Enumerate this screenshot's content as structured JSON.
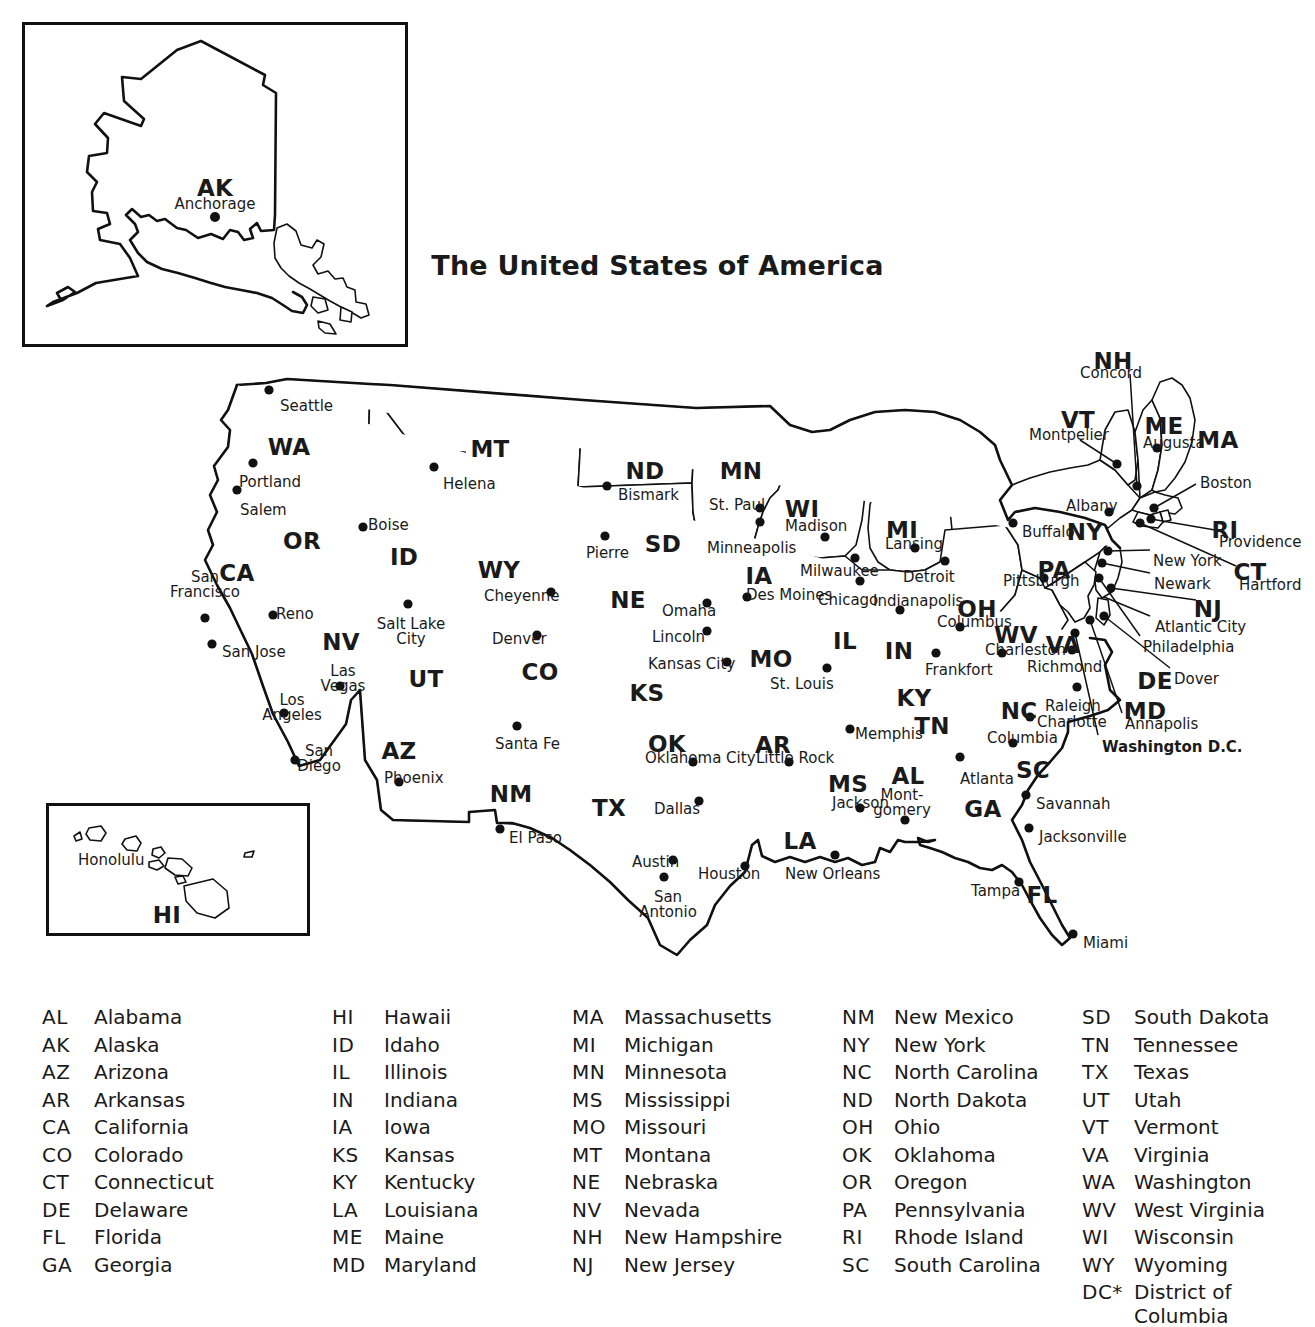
{
  "title": "The United States of America",
  "insets": [
    {
      "key": "ak",
      "abbr": "AK",
      "city": "Anchorage"
    },
    {
      "key": "hi",
      "abbr": "HI",
      "city": "Honolulu"
    }
  ],
  "state_labels": [
    {
      "abbr": "WA",
      "x": 289,
      "y": 436
    },
    {
      "abbr": "OR",
      "x": 302,
      "y": 530
    },
    {
      "abbr": "CA",
      "x": 237,
      "y": 562
    },
    {
      "abbr": "NV",
      "x": 341,
      "y": 631
    },
    {
      "abbr": "ID",
      "x": 404,
      "y": 546
    },
    {
      "abbr": "MT",
      "x": 490,
      "y": 438
    },
    {
      "abbr": "WY",
      "x": 499,
      "y": 559
    },
    {
      "abbr": "UT",
      "x": 426,
      "y": 668
    },
    {
      "abbr": "AZ",
      "x": 399,
      "y": 740
    },
    {
      "abbr": "CO",
      "x": 540,
      "y": 661
    },
    {
      "abbr": "NM",
      "x": 511,
      "y": 783
    },
    {
      "abbr": "TX",
      "x": 609,
      "y": 797
    },
    {
      "abbr": "ND",
      "x": 645,
      "y": 460
    },
    {
      "abbr": "SD",
      "x": 663,
      "y": 533
    },
    {
      "abbr": "NE",
      "x": 628,
      "y": 589
    },
    {
      "abbr": "KS",
      "x": 647,
      "y": 682
    },
    {
      "abbr": "OK",
      "x": 667,
      "y": 733
    },
    {
      "abbr": "MN",
      "x": 741,
      "y": 460
    },
    {
      "abbr": "IA",
      "x": 759,
      "y": 565
    },
    {
      "abbr": "MO",
      "x": 771,
      "y": 648
    },
    {
      "abbr": "AR",
      "x": 773,
      "y": 734
    },
    {
      "abbr": "LA",
      "x": 800,
      "y": 830
    },
    {
      "abbr": "WI",
      "x": 802,
      "y": 498
    },
    {
      "abbr": "IL",
      "x": 845,
      "y": 630
    },
    {
      "abbr": "MS",
      "x": 848,
      "y": 773
    },
    {
      "abbr": "MI",
      "x": 902,
      "y": 519
    },
    {
      "abbr": "IN",
      "x": 899,
      "y": 640
    },
    {
      "abbr": "KY",
      "x": 914,
      "y": 687
    },
    {
      "abbr": "TN",
      "x": 932,
      "y": 715
    },
    {
      "abbr": "AL",
      "x": 908,
      "y": 765
    },
    {
      "abbr": "GA",
      "x": 983,
      "y": 798
    },
    {
      "abbr": "OH",
      "x": 977,
      "y": 598
    },
    {
      "abbr": "WV",
      "x": 1016,
      "y": 624
    },
    {
      "abbr": "VA",
      "x": 1063,
      "y": 634
    },
    {
      "abbr": "NC",
      "x": 1019,
      "y": 700
    },
    {
      "abbr": "SC",
      "x": 1033,
      "y": 759
    },
    {
      "abbr": "FL",
      "x": 1042,
      "y": 884
    },
    {
      "abbr": "PA",
      "x": 1054,
      "y": 559
    },
    {
      "abbr": "NY",
      "x": 1085,
      "y": 521
    },
    {
      "abbr": "VT",
      "x": 1078,
      "y": 409
    },
    {
      "abbr": "NH",
      "x": 1113,
      "y": 350
    },
    {
      "abbr": "ME",
      "x": 1164,
      "y": 415
    },
    {
      "abbr": "MA",
      "x": 1218,
      "y": 429
    },
    {
      "abbr": "RI",
      "x": 1225,
      "y": 519
    },
    {
      "abbr": "CT",
      "x": 1250,
      "y": 561
    },
    {
      "abbr": "NJ",
      "x": 1208,
      "y": 598
    },
    {
      "abbr": "DE",
      "x": 1155,
      "y": 670
    },
    {
      "abbr": "MD",
      "x": 1145,
      "y": 700
    }
  ],
  "cities": [
    {
      "name": "Seattle",
      "x": 280,
      "y": 399,
      "align": "left",
      "dot": {
        "x": 269,
        "y": 390
      }
    },
    {
      "name": "Portland",
      "x": 239,
      "y": 475,
      "align": "left",
      "dot": {
        "x": 253,
        "y": 463
      }
    },
    {
      "name": "Salem",
      "x": 240,
      "y": 503,
      "align": "left",
      "dot": {
        "x": 237,
        "y": 490
      }
    },
    {
      "name": "Boise",
      "x": 368,
      "y": 518,
      "align": "left",
      "dot": {
        "x": 363,
        "y": 527
      }
    },
    {
      "name": "Helena",
      "x": 443,
      "y": 477,
      "align": "left",
      "dot": {
        "x": 434,
        "y": 467
      }
    },
    {
      "name": "Cheyenne",
      "x": 484,
      "y": 589,
      "align": "left",
      "dot": {
        "x": 551,
        "y": 592
      }
    },
    {
      "name": "Denver",
      "x": 492,
      "y": 632,
      "align": "left",
      "dot": {
        "x": 537,
        "y": 635
      }
    },
    {
      "name": "Reno",
      "x": 276,
      "y": 607,
      "align": "left",
      "dot": {
        "x": 273,
        "y": 615
      }
    },
    {
      "name": "San Jose",
      "x": 222,
      "y": 645,
      "align": "left",
      "dot": {
        "x": 212,
        "y": 644
      }
    },
    {
      "name": "Santa Fe",
      "x": 495,
      "y": 737,
      "align": "left",
      "dot": {
        "x": 517,
        "y": 726
      }
    },
    {
      "name": "Phoenix",
      "x": 384,
      "y": 771,
      "align": "left",
      "dot": {
        "x": 399,
        "y": 782
      }
    },
    {
      "name": "El Paso",
      "x": 509,
      "y": 831,
      "align": "left",
      "dot": {
        "x": 500,
        "y": 829
      }
    },
    {
      "name": "Bismark",
      "x": 618,
      "y": 488,
      "align": "left",
      "dot": {
        "x": 607,
        "y": 486
      }
    },
    {
      "name": "Pierre",
      "x": 586,
      "y": 546,
      "align": "left",
      "dot": {
        "x": 605,
        "y": 536
      }
    },
    {
      "name": "St. Paul",
      "x": 709,
      "y": 498,
      "align": "left",
      "dot": {
        "x": 760,
        "y": 508
      }
    },
    {
      "name": "Minneapolis",
      "x": 707,
      "y": 541,
      "align": "left",
      "dot": {
        "x": 760,
        "y": 522
      }
    },
    {
      "name": "Omaha",
      "x": 662,
      "y": 604,
      "align": "left",
      "dot": {
        "x": 707,
        "y": 603
      }
    },
    {
      "name": "Lincoln",
      "x": 652,
      "y": 630,
      "align": "left",
      "dot": {
        "x": 707,
        "y": 631
      }
    },
    {
      "name": "Kansas City",
      "x": 648,
      "y": 657,
      "align": "left",
      "dot": {
        "x": 727,
        "y": 662
      }
    },
    {
      "name": "Des Moines",
      "x": 746,
      "y": 588,
      "align": "left",
      "dot": {
        "x": 747,
        "y": 597
      }
    },
    {
      "name": "St. Louis",
      "x": 770,
      "y": 677,
      "align": "left",
      "dot": {
        "x": 827,
        "y": 668
      }
    },
    {
      "name": "Madison",
      "x": 785,
      "y": 519,
      "align": "left",
      "dot": {
        "x": 825,
        "y": 537
      }
    },
    {
      "name": "Milwaukee",
      "x": 800,
      "y": 564,
      "align": "left",
      "dot": {
        "x": 855,
        "y": 558
      }
    },
    {
      "name": "Chicago",
      "x": 818,
      "y": 593,
      "align": "left",
      "dot": {
        "x": 860,
        "y": 581
      }
    },
    {
      "name": "Lansing",
      "x": 885,
      "y": 537,
      "align": "left",
      "dot": {
        "x": 915,
        "y": 548
      }
    },
    {
      "name": "Detroit",
      "x": 903,
      "y": 570,
      "align": "left",
      "dot": {
        "x": 945,
        "y": 561
      }
    },
    {
      "name": "Indianapolis",
      "x": 873,
      "y": 594,
      "align": "left",
      "dot": {
        "x": 900,
        "y": 610
      }
    },
    {
      "name": "Columbus",
      "x": 937,
      "y": 615,
      "align": "left",
      "dot": {
        "x": 960,
        "y": 627
      }
    },
    {
      "name": "Frankfort",
      "x": 925,
      "y": 663,
      "align": "left",
      "dot": {
        "x": 936,
        "y": 653
      }
    },
    {
      "name": "Memphis",
      "x": 855,
      "y": 727,
      "align": "left",
      "dot": {
        "x": 850,
        "y": 729
      }
    },
    {
      "name": "Oklahoma City",
      "x": 645,
      "y": 751,
      "align": "left",
      "dot": {
        "x": 693,
        "y": 762
      }
    },
    {
      "name": "Little Rock",
      "x": 756,
      "y": 751,
      "align": "left",
      "dot": {
        "x": 789,
        "y": 762
      }
    },
    {
      "name": "Dallas",
      "x": 654,
      "y": 802,
      "align": "left",
      "dot": {
        "x": 699,
        "y": 801
      }
    },
    {
      "name": "Austin",
      "x": 632,
      "y": 855,
      "align": "left",
      "dot": {
        "x": 673,
        "y": 860
      }
    },
    {
      "name": "Houston",
      "x": 698,
      "y": 867,
      "align": "left",
      "dot": {
        "x": 745,
        "y": 866
      }
    },
    {
      "name": "Jackson",
      "x": 832,
      "y": 796,
      "align": "left",
      "dot": {
        "x": 860,
        "y": 808
      }
    },
    {
      "name": "New Orleans",
      "x": 785,
      "y": 867,
      "align": "left",
      "dot": {
        "x": 835,
        "y": 855
      }
    },
    {
      "name": "Atlanta",
      "x": 960,
      "y": 772,
      "align": "left",
      "dot": {
        "x": 960,
        "y": 757
      }
    },
    {
      "name": "Savannah",
      "x": 1036,
      "y": 797,
      "align": "left",
      "dot": {
        "x": 1026,
        "y": 795
      }
    },
    {
      "name": "Jacksonville",
      "x": 1039,
      "y": 830,
      "align": "left",
      "dot": {
        "x": 1029,
        "y": 828
      }
    },
    {
      "name": "Tampa",
      "x": 971,
      "y": 884,
      "align": "left",
      "dot": {
        "x": 1019,
        "y": 882
      }
    },
    {
      "name": "Miami",
      "x": 1083,
      "y": 936,
      "align": "left",
      "dot": {
        "x": 1073,
        "y": 934
      }
    },
    {
      "name": "Columbia",
      "x": 987,
      "y": 731,
      "align": "left",
      "dot": {
        "x": 1013,
        "y": 743
      }
    },
    {
      "name": "Raleigh",
      "x": 1045,
      "y": 699,
      "align": "left",
      "dot": {
        "x": 1077,
        "y": 687
      }
    },
    {
      "name": "Charlotte",
      "x": 1037,
      "y": 715,
      "align": "left",
      "dot": {
        "x": 1030,
        "y": 717
      }
    },
    {
      "name": "Charleston",
      "x": 985,
      "y": 643,
      "align": "left",
      "dot": {
        "x": 1002,
        "y": 653
      }
    },
    {
      "name": "Richmond",
      "x": 1027,
      "y": 660,
      "align": "left",
      "dot": {
        "x": 1072,
        "y": 650
      }
    },
    {
      "name": "Pittsburgh",
      "x": 1003,
      "y": 574,
      "align": "left",
      "dot": {
        "x": 1044,
        "y": 578
      }
    },
    {
      "name": "Buffalo",
      "x": 1022,
      "y": 525,
      "align": "left",
      "dot": {
        "x": 1013,
        "y": 523
      }
    },
    {
      "name": "Albany",
      "x": 1066,
      "y": 499,
      "align": "left",
      "dot": {
        "x": 1109,
        "y": 512
      }
    },
    {
      "name": "Montpelier",
      "x": 1029,
      "y": 428,
      "align": "left",
      "dot": {
        "x": 1117,
        "y": 464
      }
    },
    {
      "name": "Concord",
      "x": 1080,
      "y": 366,
      "align": "left",
      "dot": {
        "x": 1137,
        "y": 486
      }
    },
    {
      "name": "Augusta",
      "x": 1143,
      "y": 436,
      "align": "left",
      "dot": {
        "x": 1157,
        "y": 448
      }
    },
    {
      "name": "Boston",
      "x": 1200,
      "y": 476,
      "align": "left",
      "dot": {
        "x": 1154,
        "y": 508
      }
    },
    {
      "name": "Providence",
      "x": 1219,
      "y": 535,
      "align": "left",
      "dot": {
        "x": 1151,
        "y": 519
      }
    },
    {
      "name": "Hartford",
      "x": 1239,
      "y": 578,
      "align": "left",
      "dot": {
        "x": 1140,
        "y": 523
      }
    },
    {
      "name": "New York",
      "x": 1153,
      "y": 554,
      "align": "left",
      "dot": {
        "x": 1108,
        "y": 551
      }
    },
    {
      "name": "Newark",
      "x": 1154,
      "y": 577,
      "align": "left",
      "dot": {
        "x": 1102,
        "y": 563
      }
    },
    {
      "name": "Atlantic City",
      "x": 1155,
      "y": 620,
      "align": "left",
      "dot": {
        "x": 1111,
        "y": 588
      }
    },
    {
      "name": "Philadelphia",
      "x": 1143,
      "y": 640,
      "align": "left",
      "dot": {
        "x": 1099,
        "y": 578
      }
    },
    {
      "name": "Dover",
      "x": 1174,
      "y": 672,
      "align": "left",
      "dot": {
        "x": 1104,
        "y": 616
      }
    },
    {
      "name": "Annapolis",
      "x": 1125,
      "y": 717,
      "align": "left",
      "dot": {
        "x": 1090,
        "y": 620
      }
    }
  ],
  "bold_cities": [
    {
      "name": "Washington D.C.",
      "x": 1102,
      "y": 740,
      "dot": {
        "x": 1075,
        "y": 633
      }
    }
  ],
  "two_line_cities": [
    {
      "line1": "San",
      "line2": "Francisco",
      "x": 205,
      "y": 570,
      "dot": {
        "x": 205,
        "y": 618
      }
    },
    {
      "line1": "Los",
      "line2": "Angeles",
      "x": 292,
      "y": 693,
      "dot": {
        "x": 284,
        "y": 713
      }
    },
    {
      "line1": "San",
      "line2": "Diego",
      "x": 319,
      "y": 744,
      "dot": {
        "x": 295,
        "y": 760
      }
    },
    {
      "line1": "Las",
      "line2": "Vegas",
      "x": 343,
      "y": 664,
      "dot": {
        "x": 340,
        "y": 686
      }
    },
    {
      "line1": "Salt Lake",
      "line2": "City",
      "x": 411,
      "y": 617,
      "dot": {
        "x": 408,
        "y": 604
      }
    },
    {
      "line1": "San",
      "line2": "Antonio",
      "x": 668,
      "y": 890,
      "dot": {
        "x": 664,
        "y": 877
      }
    },
    {
      "line1": "Mont-",
      "line2": "gomery",
      "x": 902,
      "y": 788,
      "dot": {
        "x": 905,
        "y": 820
      }
    }
  ],
  "leader_lines": [
    {
      "from": [
        1130,
        374
      ],
      "to": [
        1137,
        486
      ]
    },
    {
      "from": [
        1080,
        440
      ],
      "to": [
        1117,
        464
      ]
    },
    {
      "from": [
        1196,
        484
      ],
      "to": [
        1154,
        508
      ]
    },
    {
      "from": [
        1215,
        530
      ],
      "to": [
        1151,
        519
      ]
    },
    {
      "from": [
        1236,
        566
      ],
      "to": [
        1140,
        523
      ]
    },
    {
      "from": [
        1150,
        550
      ],
      "to": [
        1108,
        551
      ]
    },
    {
      "from": [
        1150,
        573
      ],
      "to": [
        1102,
        563
      ]
    },
    {
      "from": [
        1196,
        600
      ],
      "to": [
        1111,
        588
      ]
    },
    {
      "from": [
        1150,
        616
      ],
      "to": [
        1104,
        597
      ]
    },
    {
      "from": [
        1140,
        636
      ],
      "to": [
        1099,
        578
      ]
    },
    {
      "from": [
        1170,
        668
      ],
      "to": [
        1104,
        616
      ]
    },
    {
      "from": [
        1122,
        713
      ],
      "to": [
        1090,
        620
      ]
    },
    {
      "from": [
        1098,
        735
      ],
      "to": [
        1075,
        633
      ]
    }
  ],
  "legend_columns": [
    [
      {
        "abbr": "AL",
        "name": "Alabama"
      },
      {
        "abbr": "AK",
        "name": "Alaska"
      },
      {
        "abbr": "AZ",
        "name": "Arizona"
      },
      {
        "abbr": "AR",
        "name": "Arkansas"
      },
      {
        "abbr": "CA",
        "name": "California"
      },
      {
        "abbr": "CO",
        "name": "Colorado"
      },
      {
        "abbr": "CT",
        "name": "Connecticut"
      },
      {
        "abbr": "DE",
        "name": "Delaware"
      },
      {
        "abbr": "FL",
        "name": "Florida"
      },
      {
        "abbr": "GA",
        "name": "Georgia"
      }
    ],
    [
      {
        "abbr": "HI",
        "name": "Hawaii"
      },
      {
        "abbr": "ID",
        "name": "Idaho"
      },
      {
        "abbr": "IL",
        "name": "Illinois"
      },
      {
        "abbr": "IN",
        "name": "Indiana"
      },
      {
        "abbr": "IA",
        "name": "Iowa"
      },
      {
        "abbr": "KS",
        "name": "Kansas"
      },
      {
        "abbr": "KY",
        "name": "Kentucky"
      },
      {
        "abbr": "LA",
        "name": "Louisiana"
      },
      {
        "abbr": "ME",
        "name": "Maine"
      },
      {
        "abbr": "MD",
        "name": "Maryland"
      }
    ],
    [
      {
        "abbr": "MA",
        "name": "Massachusetts"
      },
      {
        "abbr": "MI",
        "name": "Michigan"
      },
      {
        "abbr": "MN",
        "name": "Minnesota"
      },
      {
        "abbr": "MS",
        "name": "Mississippi"
      },
      {
        "abbr": "MO",
        "name": "Missouri"
      },
      {
        "abbr": "MT",
        "name": "Montana"
      },
      {
        "abbr": "NE",
        "name": "Nebraska"
      },
      {
        "abbr": "NV",
        "name": "Nevada"
      },
      {
        "abbr": "NH",
        "name": "New Hampshire"
      },
      {
        "abbr": "NJ",
        "name": "New Jersey"
      }
    ],
    [
      {
        "abbr": "NM",
        "name": "New Mexico"
      },
      {
        "abbr": "NY",
        "name": "New York"
      },
      {
        "abbr": "NC",
        "name": "North Carolina"
      },
      {
        "abbr": "ND",
        "name": "North Dakota"
      },
      {
        "abbr": "OH",
        "name": "Ohio"
      },
      {
        "abbr": "OK",
        "name": "Oklahoma"
      },
      {
        "abbr": "OR",
        "name": "Oregon"
      },
      {
        "abbr": "PA",
        "name": "Pennsylvania"
      },
      {
        "abbr": "RI",
        "name": "Rhode Island"
      },
      {
        "abbr": "SC",
        "name": "South Carolina"
      }
    ],
    [
      {
        "abbr": "SD",
        "name": "South Dakota"
      },
      {
        "abbr": "TN",
        "name": "Tennessee"
      },
      {
        "abbr": "TX",
        "name": "Texas"
      },
      {
        "abbr": "UT",
        "name": "Utah"
      },
      {
        "abbr": "VT",
        "name": "Vermont"
      },
      {
        "abbr": "VA",
        "name": "Virginia"
      },
      {
        "abbr": "WA",
        "name": "Washington"
      },
      {
        "abbr": "WV",
        "name": "West Virginia"
      },
      {
        "abbr": "WI",
        "name": "Wisconsin"
      },
      {
        "abbr": "WY",
        "name": "Wyoming"
      },
      {
        "abbr": "DC*",
        "name": "District of Columbia"
      }
    ]
  ],
  "colors": {
    "ink": "#111111",
    "paper": "#ffffff"
  }
}
